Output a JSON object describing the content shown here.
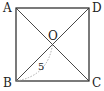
{
  "diagram": {
    "type": "geometry",
    "shape": "square",
    "vertices": {
      "A": {
        "label": "A",
        "x": 16,
        "y": 8
      },
      "D": {
        "label": "D",
        "x": 89,
        "y": 8
      },
      "B": {
        "label": "B",
        "x": 16,
        "y": 81
      },
      "C": {
        "label": "C",
        "x": 89,
        "y": 81
      }
    },
    "center": {
      "label": "O",
      "x": 52.5,
      "y": 44.5
    },
    "segments": [
      "AB",
      "BC",
      "CD",
      "DA",
      "AC",
      "BD"
    ],
    "annotation": {
      "segment": "BO",
      "label": "5",
      "style": "dotted-arc"
    },
    "colors": {
      "line": "#222222",
      "dotted": "#999999",
      "background": "#ffffff"
    }
  }
}
